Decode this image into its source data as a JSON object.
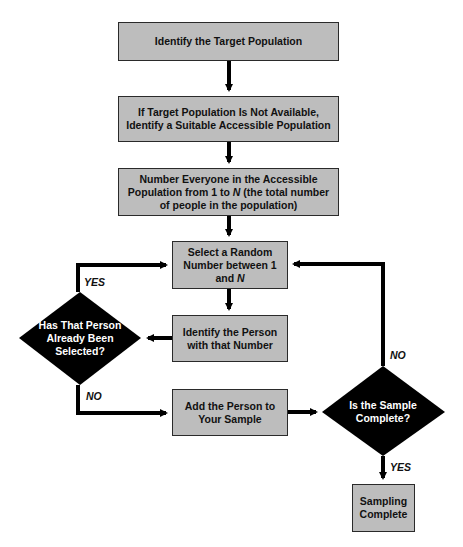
{
  "diagram": {
    "type": "flowchart",
    "colors": {
      "box_fill": "#bdbdbd",
      "diamond_fill": "#000000",
      "line": "#000000"
    },
    "boxes": [
      {
        "id": "identify-target",
        "text": "Identify the Target Population"
      },
      {
        "id": "accessible-population",
        "text": "If Target Population Is Not Available, Identify a Suitable Accessible Population"
      },
      {
        "id": "number-everyone",
        "text_before": "Number Everyone in the Accessible Population from 1 to ",
        "text_italic": "N",
        "text_after": " (the total number of people in the population)"
      },
      {
        "id": "select-random",
        "text_before": "Select a Random Number between 1 and ",
        "text_italic": "N"
      },
      {
        "id": "identify-person",
        "text": "Identify the Person with that Number"
      },
      {
        "id": "add-person",
        "text": "Add the Person to Your Sample"
      },
      {
        "id": "sampling-complete",
        "text": "Sampling Complete"
      }
    ],
    "decisions": [
      {
        "id": "already-selected",
        "text": "Has That Person Already Been Selected?",
        "yes": "YES",
        "no": "NO"
      },
      {
        "id": "sample-complete",
        "text": "Is the Sample Complete?",
        "yes": "YES",
        "no": "NO"
      }
    ]
  }
}
